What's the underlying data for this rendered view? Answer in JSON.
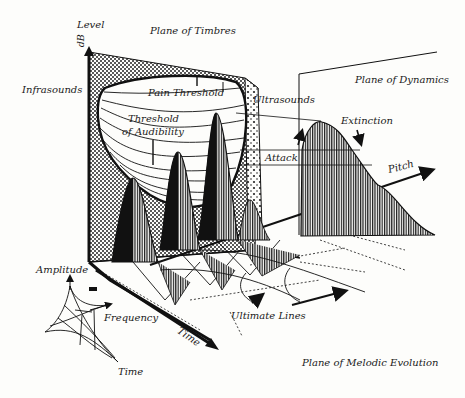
{
  "diagram": {
    "type": "3d-sound-space",
    "colors": {
      "ink": "#111111",
      "paper": "#fdfdfb",
      "hatch": "#222222",
      "dots": "#333333"
    },
    "axes": {
      "level": {
        "label": "Level",
        "unit": "dB"
      },
      "pitch": {
        "label": "Pitch"
      },
      "time": {
        "label": "Time"
      }
    },
    "planes": {
      "timbres": "Plane of Timbres",
      "dynamics": "Plane of Dynamics",
      "melodic": "Plane of Melodic Evolution"
    },
    "annotations": {
      "infrasounds": "Infrasounds",
      "ultrasounds": "Ultrasounds",
      "pain_threshold": "Pain Threshold",
      "threshold_audibility_1": "Threshold",
      "threshold_audibility_2": "of Audibility",
      "attack": "Attack",
      "extinction": "Extinction",
      "ultimate_lines": "Ultimate Lines"
    },
    "inset": {
      "amplitude": "Amplitude",
      "frequency": "Frequency",
      "time": "Time"
    }
  }
}
